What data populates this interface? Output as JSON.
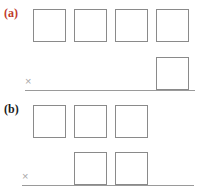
{
  "figure": {
    "width": 198,
    "height": 193,
    "background": "#ffffff",
    "block_stroke": "#8a8a8a",
    "baseline_stroke": "#9a9a9a",
    "origin_mark_color": "#a8a8a8",
    "origin_symbol": "×"
  },
  "panels": [
    {
      "id": "a",
      "label": "(a)",
      "label_color": "#c0392b",
      "label_x": 4,
      "label_y": 7,
      "baseline": {
        "x": 25,
        "y": 90,
        "width": 170
      },
      "origin": {
        "symbol": "×",
        "x": 25,
        "y": 76
      },
      "rows": [
        {
          "name": "upper-row",
          "count": 4,
          "blocks": [
            {
              "x": 33,
              "y": 9,
              "w": 33,
              "h": 33
            },
            {
              "x": 74,
              "y": 9,
              "w": 33,
              "h": 33
            },
            {
              "x": 115,
              "y": 9,
              "w": 33,
              "h": 33
            },
            {
              "x": 156,
              "y": 9,
              "w": 33,
              "h": 33
            }
          ]
        },
        {
          "name": "lower-row",
          "count": 1,
          "blocks": [
            {
              "x": 156,
              "y": 57,
              "w": 33,
              "h": 33
            }
          ]
        }
      ]
    },
    {
      "id": "b",
      "label": "(b)",
      "label_color": "#1a1a1a",
      "label_x": 4,
      "label_y": 103,
      "baseline": {
        "x": 22,
        "y": 185,
        "width": 172
      },
      "origin": {
        "symbol": "×",
        "x": 22,
        "y": 171
      },
      "rows": [
        {
          "name": "upper-row",
          "count": 3,
          "blocks": [
            {
              "x": 33,
              "y": 105,
              "w": 33,
              "h": 33
            },
            {
              "x": 74,
              "y": 105,
              "w": 33,
              "h": 33
            },
            {
              "x": 115,
              "y": 105,
              "w": 33,
              "h": 33
            }
          ]
        },
        {
          "name": "lower-row",
          "count": 2,
          "blocks": [
            {
              "x": 74,
              "y": 152,
              "w": 33,
              "h": 33
            },
            {
              "x": 115,
              "y": 152,
              "w": 33,
              "h": 33
            }
          ]
        }
      ]
    }
  ]
}
